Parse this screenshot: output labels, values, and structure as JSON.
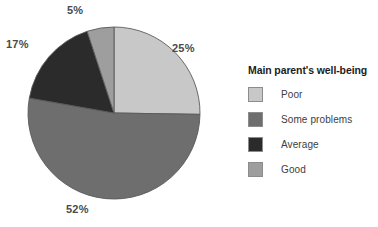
{
  "chart_data": {
    "type": "pie",
    "title": "",
    "legend_title": "Main parent's well-being",
    "legend_position": "right",
    "categories": [
      "Poor",
      "Some problems",
      "Average",
      "Good"
    ],
    "values": [
      25,
      52,
      17,
      5
    ],
    "value_labels": [
      "25%",
      "52%",
      "17%",
      "5%"
    ],
    "colors": [
      "#c8c8c8",
      "#6e6e6e",
      "#2b2b2b",
      "#9e9e9e"
    ],
    "start_angle_deg": 0,
    "direction": "clockwise",
    "slice_order": [
      "Poor",
      "Some problems",
      "Average",
      "Good"
    ],
    "outline_color": "#5a5a5a"
  },
  "pie": {
    "labels": {
      "top": "5%",
      "right": "25%",
      "left": "17%",
      "bottom": "52%"
    }
  },
  "legend": {
    "title": "Main parent's well-being",
    "items": [
      {
        "label": "Poor",
        "color": "#c8c8c8"
      },
      {
        "label": "Some problems",
        "color": "#6e6e6e"
      },
      {
        "label": "Average",
        "color": "#2b2b2b"
      },
      {
        "label": "Good",
        "color": "#9e9e9e"
      }
    ]
  }
}
